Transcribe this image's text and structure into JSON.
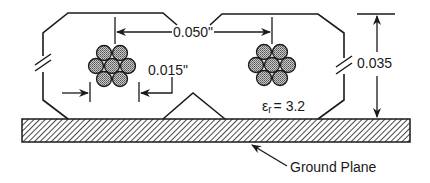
{
  "figure": {
    "type": "cable cross-section over ground plane",
    "conductor_spacing_label": "0.050\"",
    "strand_gap_label": "0.015\"",
    "height_label": "0.035",
    "dielectric_label": "εr = 3.2",
    "dielectric_symbol": "ε",
    "dielectric_subscript": "r",
    "dielectric_value": "= 3.2",
    "ground_plane_label": "Ground Plane",
    "conductors": [
      {
        "name": "left-conductor",
        "strands": 7
      },
      {
        "name": "right-conductor",
        "strands": 7
      }
    ]
  },
  "colors": {
    "line": "#1a1a1a",
    "strand_fill": "#9a9a9a",
    "background": "#ffffff"
  }
}
